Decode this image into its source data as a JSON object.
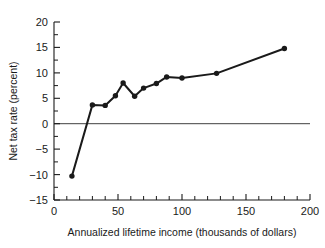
{
  "chart_data": {
    "type": "line",
    "title": "",
    "xlabel": "Annualized lifetime income (thousands of dollars)",
    "ylabel": "Net tax rate (percent)",
    "xlim": [
      0,
      200
    ],
    "ylim": [
      -15,
      20
    ],
    "xticks": [
      0,
      50,
      100,
      150,
      200
    ],
    "xtick_labels": [
      "0",
      "50",
      "100",
      "150",
      "200"
    ],
    "xminor_step": 10,
    "yticks": [
      -15,
      -10,
      -5,
      0,
      5,
      10,
      15,
      20
    ],
    "ytick_labels": [
      "−15",
      "−10",
      "−5",
      "0",
      "5",
      "10",
      "15",
      "20"
    ],
    "yminor_step": 2.5,
    "grid": false,
    "legend": "none",
    "zero_reference_line": 0,
    "marker": "filled-circle",
    "series": [
      {
        "name": "Net tax rate",
        "x": [
          14,
          30,
          40,
          48,
          54,
          63,
          70,
          80,
          88,
          100,
          127,
          180
        ],
        "y": [
          -10.3,
          3.7,
          3.6,
          5.5,
          8.0,
          5.4,
          7.0,
          7.9,
          9.2,
          9.0,
          9.9,
          14.8
        ]
      }
    ]
  },
  "axes": {
    "x_axis_name": "x-axis",
    "y_axis_name": "y-axis"
  },
  "colors": {
    "ink": "#1a1a1a",
    "background": "#ffffff",
    "zero_line": "#2b2b2b"
  }
}
